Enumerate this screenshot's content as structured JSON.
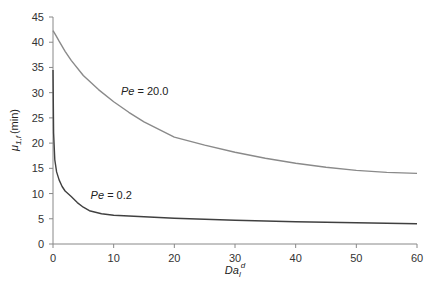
{
  "chart_data": {
    "type": "line",
    "title": "",
    "xlabel": "Da_l^d",
    "xlabel_main": "Da",
    "xlabel_sub": "l",
    "xlabel_sup": "d",
    "ylabel": "μ1,f (min)",
    "ylabel_main": "μ",
    "ylabel_sub": "1,f",
    "ylabel_unit": "(min)",
    "xlim": [
      0,
      60
    ],
    "ylim": [
      0,
      45
    ],
    "xticks": [
      0,
      10,
      20,
      30,
      40,
      50,
      60
    ],
    "yticks": [
      0,
      5,
      10,
      15,
      20,
      25,
      30,
      35,
      40,
      45
    ],
    "grid": false,
    "legend": "none (inline annotations)",
    "series": [
      {
        "name": "Pe = 20.0",
        "color": "#8a8a8a",
        "x": [
          0,
          0.5,
          1,
          2,
          3,
          5,
          7.5,
          10,
          12.5,
          15,
          20,
          25,
          30,
          35,
          40,
          45,
          50,
          55,
          60
        ],
        "y": [
          42.3,
          41.3,
          40.2,
          38.2,
          36.4,
          33.4,
          30.6,
          28.2,
          26.1,
          24.2,
          21.2,
          19.6,
          18.2,
          17.0,
          16.0,
          15.2,
          14.6,
          14.2,
          14.0
        ]
      },
      {
        "name": "Pe = 0.2",
        "color": "#404040",
        "x": [
          0,
          0.1,
          0.3,
          0.6,
          1,
          1.5,
          2,
          3,
          4,
          5,
          6,
          8,
          10,
          15,
          20,
          30,
          40,
          50,
          60
        ],
        "y": [
          34.5,
          22.0,
          16.7,
          14.3,
          12.7,
          11.4,
          10.5,
          9.4,
          8.2,
          7.3,
          6.6,
          6.0,
          5.7,
          5.4,
          5.1,
          4.7,
          4.4,
          4.2,
          4.0
        ]
      }
    ],
    "annotations": [
      {
        "text_main": "Pe",
        "text_rest": " = 20.0",
        "x": 11.2,
        "y": 29.5
      },
      {
        "text_main": "Pe",
        "text_rest": " = 0.2",
        "x": 6.2,
        "y": 9.0
      }
    ]
  }
}
